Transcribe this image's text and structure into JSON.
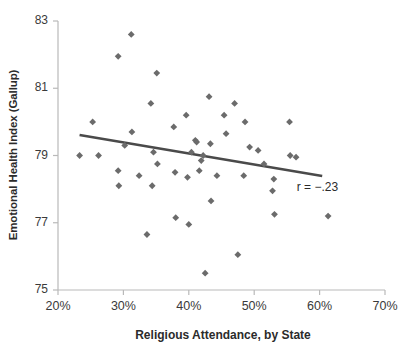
{
  "chart_data": {
    "type": "scatter",
    "title": "",
    "xlabel": "Religious Attendance, by State",
    "ylabel": "Emotional Health Index (Gallup)",
    "xlim": [
      20,
      70
    ],
    "ylim": [
      75,
      83
    ],
    "xticks": [
      20,
      30,
      40,
      50,
      60,
      70
    ],
    "xtick_labels": [
      "20%",
      "30%",
      "40%",
      "50%",
      "60%",
      "70%"
    ],
    "yticks": [
      75,
      77,
      79,
      81,
      83
    ],
    "ytick_labels": [
      "75",
      "77",
      "79",
      "81",
      "83"
    ],
    "grid": false,
    "legend": false,
    "marker": "diamond",
    "marker_color": "#6b6b6b",
    "annotations": [
      {
        "text": "r = −.23",
        "x": 56.5,
        "y": 78.05
      }
    ],
    "trendline": {
      "color": "#4a4a4a",
      "x": [
        23.3,
        60.4
      ],
      "y": [
        79.61,
        78.39
      ],
      "slope": -0.0329,
      "intercept": 80.38
    },
    "points": [
      {
        "x": 23.3,
        "y": 79.0
      },
      {
        "x": 25.3,
        "y": 80.0
      },
      {
        "x": 26.2,
        "y": 79.0
      },
      {
        "x": 29.2,
        "y": 81.95
      },
      {
        "x": 29.2,
        "y": 78.55
      },
      {
        "x": 29.3,
        "y": 78.1
      },
      {
        "x": 30.2,
        "y": 79.3
      },
      {
        "x": 31.2,
        "y": 82.6
      },
      {
        "x": 31.3,
        "y": 79.7
      },
      {
        "x": 32.4,
        "y": 78.4
      },
      {
        "x": 33.6,
        "y": 76.65
      },
      {
        "x": 34.2,
        "y": 80.55
      },
      {
        "x": 34.4,
        "y": 78.1
      },
      {
        "x": 34.6,
        "y": 79.1
      },
      {
        "x": 35.1,
        "y": 81.45
      },
      {
        "x": 35.2,
        "y": 78.75
      },
      {
        "x": 37.7,
        "y": 79.85
      },
      {
        "x": 37.9,
        "y": 78.5
      },
      {
        "x": 38.0,
        "y": 77.15
      },
      {
        "x": 39.6,
        "y": 80.2
      },
      {
        "x": 39.8,
        "y": 78.35
      },
      {
        "x": 40.0,
        "y": 76.95
      },
      {
        "x": 40.4,
        "y": 79.1
      },
      {
        "x": 41.0,
        "y": 79.45
      },
      {
        "x": 41.2,
        "y": 79.4
      },
      {
        "x": 41.6,
        "y": 78.55
      },
      {
        "x": 41.9,
        "y": 78.85
      },
      {
        "x": 42.2,
        "y": 79.0
      },
      {
        "x": 42.5,
        "y": 75.5
      },
      {
        "x": 43.1,
        "y": 80.75
      },
      {
        "x": 43.3,
        "y": 79.35
      },
      {
        "x": 43.4,
        "y": 77.65
      },
      {
        "x": 44.3,
        "y": 78.4
      },
      {
        "x": 45.4,
        "y": 80.2
      },
      {
        "x": 45.7,
        "y": 79.65
      },
      {
        "x": 47.0,
        "y": 80.55
      },
      {
        "x": 47.5,
        "y": 76.05
      },
      {
        "x": 48.4,
        "y": 78.4
      },
      {
        "x": 48.6,
        "y": 80.0
      },
      {
        "x": 49.3,
        "y": 79.25
      },
      {
        "x": 50.6,
        "y": 79.15
      },
      {
        "x": 51.5,
        "y": 78.75
      },
      {
        "x": 52.8,
        "y": 77.95
      },
      {
        "x": 53.0,
        "y": 78.3
      },
      {
        "x": 53.1,
        "y": 77.25
      },
      {
        "x": 55.4,
        "y": 80.0
      },
      {
        "x": 55.5,
        "y": 79.0
      },
      {
        "x": 56.4,
        "y": 78.95
      },
      {
        "x": 61.3,
        "y": 77.2
      }
    ]
  }
}
